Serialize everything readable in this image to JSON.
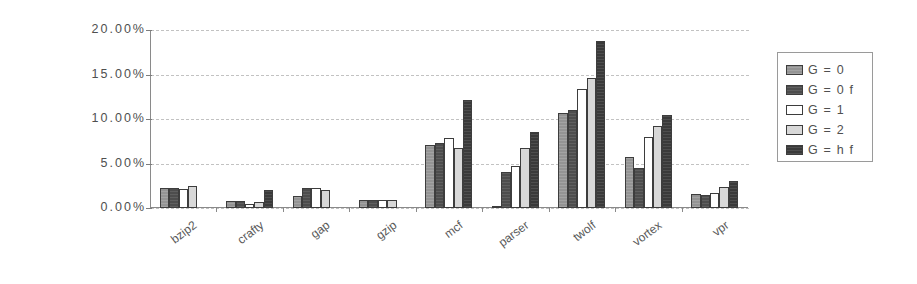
{
  "chart_data": {
    "type": "bar",
    "title": "",
    "xlabel": "",
    "ylabel": "",
    "ylim": [
      0,
      20
    ],
    "ytick_labels": [
      "20.00%",
      "15.00%",
      "10.00%",
      "5.00%",
      "0.00%"
    ],
    "ytick_values": [
      20,
      15,
      10,
      5,
      0
    ],
    "grid": true,
    "legend_position": "right",
    "categories": [
      "bzip2",
      "crafty",
      "gap",
      "gzip",
      "mcf",
      "parser",
      "twolf",
      "vortex",
      "vpr"
    ],
    "series": [
      {
        "name": "G = 0",
        "color": "#949494",
        "values": [
          2.3,
          0.8,
          1.3,
          0.9,
          7.1,
          0.2,
          10.7,
          5.7,
          1.6
        ]
      },
      {
        "name": "G = 0 f",
        "color": "#4d4d4d",
        "values": [
          2.3,
          0.8,
          2.3,
          0.9,
          7.3,
          4.0,
          11.0,
          4.5,
          1.5
        ]
      },
      {
        "name": "G = 1",
        "color": "#ffffff",
        "values": [
          2.1,
          0.5,
          2.3,
          0.9,
          7.9,
          4.7,
          13.4,
          8.0,
          1.7
        ]
      },
      {
        "name": "G = 2",
        "color": "#d8d8d8",
        "values": [
          2.5,
          0.7,
          2.0,
          0.9,
          6.7,
          6.7,
          14.6,
          9.2,
          2.4
        ]
      },
      {
        "name": "G = h f",
        "color": "#3a3a3a",
        "values": [
          0.0,
          2.0,
          0.0,
          0.0,
          12.1,
          8.5,
          18.8,
          10.5,
          3.0
        ]
      }
    ]
  },
  "legend": {
    "items": [
      {
        "label": "G = 0"
      },
      {
        "label": "G = 0 f"
      },
      {
        "label": "G = 1"
      },
      {
        "label": "G = 2"
      },
      {
        "label": "G = h f"
      }
    ]
  }
}
